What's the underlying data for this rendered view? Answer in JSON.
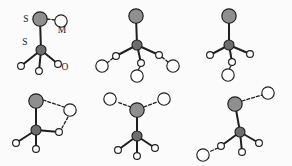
{
  "figure": {
    "rows": 2,
    "columns": 3,
    "background_color": "#fbfbfb",
    "atom_styles": {
      "sulfur_terminal": {
        "fill": "#8f8f8f",
        "stroke": "#1f1f1f",
        "radius": 7.2
      },
      "sulfur_center": {
        "fill": "#6d6d6d",
        "stroke": "#1f1f1f",
        "radius": 5.0
      },
      "oxygen_small": {
        "fill": "#ffffff",
        "stroke": "#1f1f1f",
        "radius": 3.4
      },
      "water_large": {
        "fill": "#ffffff",
        "stroke": "#1f1f1f",
        "radius": 6.2
      }
    },
    "bond_styles": {
      "covalent": {
        "color": "#1f1f1f",
        "width": 2.0,
        "dash": "none"
      },
      "hydrogen": {
        "color": "#1f1f1f",
        "width": 1.3,
        "dash": "3,2"
      }
    },
    "panels": [
      {
        "id": "panel-a",
        "index": 1,
        "position": "top-left",
        "labels": [
          {
            "text": "S",
            "x": 26,
            "y": 22,
            "for": "terminal-sulfur"
          },
          {
            "text": "M",
            "x": 62,
            "y": 33,
            "for": "water-molecule"
          },
          {
            "text": "S",
            "x": 25,
            "y": 45,
            "for": "central-sulfur"
          },
          {
            "text": "O",
            "x": 65,
            "y": 70,
            "for": "oxygen"
          }
        ],
        "atoms": [
          {
            "name": "terminal-sulfur",
            "type": "sulfur_terminal",
            "x": 40,
            "y": 19
          },
          {
            "name": "water-molecule",
            "type": "water_large",
            "x": 61,
            "y": 21
          },
          {
            "name": "central-sulfur",
            "type": "sulfur_center",
            "x": 41,
            "y": 50
          },
          {
            "name": "oxygen-1",
            "type": "oxygen_small",
            "x": 21,
            "y": 66
          },
          {
            "name": "oxygen-2",
            "type": "oxygen_small",
            "x": 39,
            "y": 71
          },
          {
            "name": "oxygen-3",
            "type": "oxygen_small",
            "x": 58,
            "y": 64
          }
        ],
        "bonds": [
          {
            "type": "covalent",
            "from": [
              40,
              19
            ],
            "to": [
              41,
              50
            ]
          },
          {
            "type": "covalent",
            "from": [
              41,
              50
            ],
            "to": [
              21,
              66
            ]
          },
          {
            "type": "covalent",
            "from": [
              41,
              50
            ],
            "to": [
              39,
              71
            ]
          },
          {
            "type": "covalent",
            "from": [
              41,
              50
            ],
            "to": [
              58,
              64
            ]
          },
          {
            "type": "hydrogen",
            "from": [
              47,
              19
            ],
            "to": [
              55,
              20
            ]
          }
        ]
      },
      {
        "id": "panel-b",
        "index": 2,
        "position": "top-center",
        "labels": [],
        "atoms": [
          {
            "name": "terminal-sulfur",
            "type": "sulfur_terminal",
            "x": 136,
            "y": 16
          },
          {
            "name": "central-sulfur",
            "type": "sulfur_center",
            "x": 137,
            "y": 45
          },
          {
            "name": "oxygen-1",
            "type": "oxygen_small",
            "x": 116,
            "y": 56
          },
          {
            "name": "oxygen-2",
            "type": "oxygen_small",
            "x": 141,
            "y": 63
          },
          {
            "name": "oxygen-3",
            "type": "oxygen_small",
            "x": 159,
            "y": 55
          },
          {
            "name": "water-1",
            "type": "water_large",
            "x": 102,
            "y": 66
          },
          {
            "name": "water-2",
            "type": "water_large",
            "x": 137,
            "y": 76
          },
          {
            "name": "water-3",
            "type": "water_large",
            "x": 173,
            "y": 66
          }
        ],
        "bonds": [
          {
            "type": "covalent",
            "from": [
              136,
              16
            ],
            "to": [
              137,
              45
            ]
          },
          {
            "type": "covalent",
            "from": [
              137,
              45
            ],
            "to": [
              116,
              56
            ]
          },
          {
            "type": "covalent",
            "from": [
              137,
              45
            ],
            "to": [
              141,
              63
            ]
          },
          {
            "type": "covalent",
            "from": [
              137,
              45
            ],
            "to": [
              159,
              55
            ]
          },
          {
            "type": "hydrogen",
            "from": [
              113,
              58
            ],
            "to": [
              107,
              63
            ]
          },
          {
            "type": "hydrogen",
            "from": [
              140,
              67
            ],
            "to": [
              138,
              70
            ]
          },
          {
            "type": "hydrogen",
            "from": [
              162,
              57
            ],
            "to": [
              168,
              62
            ]
          }
        ]
      },
      {
        "id": "panel-c",
        "index": 3,
        "position": "top-right",
        "labels": [],
        "atoms": [
          {
            "name": "terminal-sulfur",
            "type": "sulfur_terminal",
            "x": 229,
            "y": 16
          },
          {
            "name": "central-sulfur",
            "type": "sulfur_center",
            "x": 229,
            "y": 45
          },
          {
            "name": "oxygen-1",
            "type": "oxygen_small",
            "x": 210,
            "y": 55
          },
          {
            "name": "oxygen-2",
            "type": "oxygen_small",
            "x": 232,
            "y": 62
          },
          {
            "name": "oxygen-3",
            "type": "oxygen_small",
            "x": 250,
            "y": 54
          },
          {
            "name": "water-1",
            "type": "water_large",
            "x": 228,
            "y": 75
          }
        ],
        "bonds": [
          {
            "type": "covalent",
            "from": [
              229,
              16
            ],
            "to": [
              229,
              45
            ]
          },
          {
            "type": "covalent",
            "from": [
              229,
              45
            ],
            "to": [
              210,
              55
            ]
          },
          {
            "type": "covalent",
            "from": [
              229,
              45
            ],
            "to": [
              232,
              62
            ]
          },
          {
            "type": "covalent",
            "from": [
              229,
              45
            ],
            "to": [
              250,
              54
            ]
          },
          {
            "type": "hydrogen",
            "from": [
              231,
              66
            ],
            "to": [
              229,
              69
            ]
          }
        ]
      },
      {
        "id": "panel-d",
        "index": 4,
        "position": "bottom-left",
        "labels": [],
        "atoms": [
          {
            "name": "terminal-sulfur",
            "type": "sulfur_terminal",
            "x": 36,
            "y": 101
          },
          {
            "name": "central-sulfur",
            "type": "sulfur_center",
            "x": 36,
            "y": 130
          },
          {
            "name": "water-1",
            "type": "water_large",
            "x": 70,
            "y": 110
          },
          {
            "name": "oxygen-bridge",
            "type": "oxygen_small",
            "x": 59,
            "y": 132
          },
          {
            "name": "oxygen-1",
            "type": "oxygen_small",
            "x": 16,
            "y": 143
          },
          {
            "name": "oxygen-2",
            "type": "oxygen_small",
            "x": 36,
            "y": 149
          }
        ],
        "bonds": [
          {
            "type": "covalent",
            "from": [
              36,
              101
            ],
            "to": [
              36,
              130
            ]
          },
          {
            "type": "covalent",
            "from": [
              36,
              130
            ],
            "to": [
              59,
              132
            ]
          },
          {
            "type": "covalent",
            "from": [
              36,
              130
            ],
            "to": [
              16,
              143
            ]
          },
          {
            "type": "covalent",
            "from": [
              36,
              130
            ],
            "to": [
              36,
              149
            ]
          },
          {
            "type": "hydrogen",
            "from": [
              43,
              100
            ],
            "to": [
              64,
              107
            ]
          },
          {
            "type": "hydrogen",
            "from": [
              68,
              117
            ],
            "to": [
              62,
              128
            ]
          }
        ]
      },
      {
        "id": "panel-e",
        "index": 5,
        "position": "bottom-center",
        "labels": [],
        "atoms": [
          {
            "name": "terminal-sulfur",
            "type": "sulfur_terminal",
            "x": 137,
            "y": 110
          },
          {
            "name": "central-sulfur",
            "type": "sulfur_center",
            "x": 137,
            "y": 136
          },
          {
            "name": "water-1",
            "type": "water_large",
            "x": 110,
            "y": 99
          },
          {
            "name": "water-2",
            "type": "water_large",
            "x": 164,
            "y": 99
          },
          {
            "name": "oxygen-1",
            "type": "oxygen_small",
            "x": 118,
            "y": 150
          },
          {
            "name": "oxygen-2",
            "type": "oxygen_small",
            "x": 137,
            "y": 156
          },
          {
            "name": "oxygen-3",
            "type": "oxygen_small",
            "x": 155,
            "y": 148
          }
        ],
        "bonds": [
          {
            "type": "covalent",
            "from": [
              137,
              110
            ],
            "to": [
              137,
              136
            ]
          },
          {
            "type": "covalent",
            "from": [
              137,
              136
            ],
            "to": [
              118,
              150
            ]
          },
          {
            "type": "covalent",
            "from": [
              137,
              136
            ],
            "to": [
              137,
              156
            ]
          },
          {
            "type": "covalent",
            "from": [
              137,
              136
            ],
            "to": [
              155,
              148
            ]
          },
          {
            "type": "hydrogen",
            "from": [
              131,
              107
            ],
            "to": [
              117,
              102
            ]
          },
          {
            "type": "hydrogen",
            "from": [
              144,
              107
            ],
            "to": [
              157,
              102
            ]
          }
        ]
      },
      {
        "id": "panel-f",
        "index": 6,
        "position": "bottom-right",
        "labels": [],
        "atoms": [
          {
            "name": "terminal-sulfur",
            "type": "sulfur_terminal",
            "x": 235,
            "y": 104
          },
          {
            "name": "central-sulfur",
            "type": "sulfur_center",
            "x": 240,
            "y": 132
          },
          {
            "name": "water-1",
            "type": "water_large",
            "x": 268,
            "y": 93
          },
          {
            "name": "oxygen-1",
            "type": "oxygen_small",
            "x": 221,
            "y": 146
          },
          {
            "name": "oxygen-2",
            "type": "oxygen_small",
            "x": 242,
            "y": 152
          },
          {
            "name": "oxygen-3",
            "type": "oxygen_small",
            "x": 259,
            "y": 143
          },
          {
            "name": "water-2",
            "type": "water_large",
            "x": 203,
            "y": 155
          }
        ],
        "bonds": [
          {
            "type": "covalent",
            "from": [
              235,
              104
            ],
            "to": [
              240,
              132
            ]
          },
          {
            "type": "covalent",
            "from": [
              240,
              132
            ],
            "to": [
              221,
              146
            ]
          },
          {
            "type": "covalent",
            "from": [
              240,
              132
            ],
            "to": [
              242,
              152
            ]
          },
          {
            "type": "covalent",
            "from": [
              240,
              132
            ],
            "to": [
              259,
              143
            ]
          },
          {
            "type": "hydrogen",
            "from": [
              242,
              101
            ],
            "to": [
              262,
              95
            ]
          },
          {
            "type": "hydrogen",
            "from": [
              218,
              148
            ],
            "to": [
              209,
              152
            ]
          }
        ]
      }
    ]
  }
}
